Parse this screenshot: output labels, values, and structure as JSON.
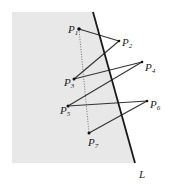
{
  "diagram": {
    "line_label": "L",
    "points": [
      {
        "name": "P",
        "sub": "1",
        "x": 79,
        "y": 29,
        "lx": 68,
        "ly": 33
      },
      {
        "name": "P",
        "sub": "2",
        "x": 119,
        "y": 41,
        "lx": 122,
        "ly": 48
      },
      {
        "name": "P",
        "sub": "3",
        "x": 74,
        "y": 79,
        "lx": 64,
        "ly": 86
      },
      {
        "name": "P",
        "sub": "4",
        "x": 142,
        "y": 62,
        "lx": 145,
        "ly": 72
      },
      {
        "name": "P",
        "sub": "5",
        "x": 68,
        "y": 106,
        "lx": 60,
        "ly": 115
      },
      {
        "name": "P",
        "sub": "6",
        "x": 147,
        "y": 101,
        "lx": 150,
        "ly": 109
      },
      {
        "name": "P",
        "sub": "7",
        "x": 89,
        "y": 133,
        "lx": 88,
        "ly": 147
      }
    ],
    "edges": [
      [
        "1",
        "2"
      ],
      [
        "2",
        "3"
      ],
      [
        "3",
        "4"
      ],
      [
        "4",
        "5"
      ],
      [
        "5",
        "6"
      ],
      [
        "6",
        "7"
      ]
    ],
    "dotted_edge": [
      "1",
      "7"
    ],
    "colors": {
      "shade": "#e8e8e8",
      "line": "#1a1a1a",
      "edge": "#333333"
    }
  }
}
